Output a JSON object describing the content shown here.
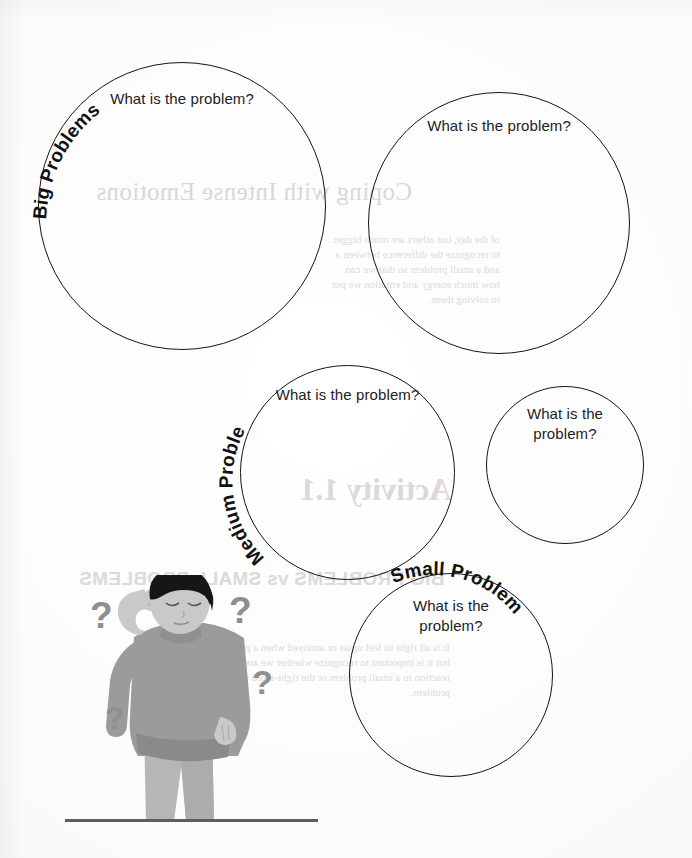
{
  "page": {
    "title": "Big Problems vs Small Problems",
    "background_color": "#fdfdfd",
    "ink_color": "#141414",
    "width": 692,
    "height": 858
  },
  "worksheet": {
    "prompt_text": "What is the problem?",
    "circles": [
      {
        "id": "big-problem-1",
        "category_label": "Big Problems",
        "prompt": "What is the problem?",
        "size": "large",
        "x": 38,
        "y": 62,
        "diameter": 288
      },
      {
        "id": "big-problem-2",
        "category_label": "",
        "prompt": "What is the problem?",
        "size": "large",
        "x": 368,
        "y": 92,
        "diameter": 262
      },
      {
        "id": "medium-problem-1",
        "category_label": "Medium Problems",
        "prompt": "What is the problem?",
        "size": "medium",
        "x": 240,
        "y": 365,
        "diameter": 215
      },
      {
        "id": "medium-problem-2",
        "category_label": "",
        "prompt": "What is the problem?",
        "size": "medium",
        "x": 486,
        "y": 386,
        "diameter": 158
      },
      {
        "id": "small-problem-1",
        "category_label": "Small Problem",
        "prompt": "What is the problem?",
        "size": "small",
        "x": 349,
        "y": 573,
        "diameter": 204
      }
    ],
    "category_labels": [
      "Big Problems",
      "Medium Problems",
      "Small Problem"
    ]
  },
  "illustration": {
    "name": "confused-person-with-question-marks",
    "description": "Grayscale drawing of a person scratching their head surrounded by question marks",
    "question_mark_glyph": "?",
    "question_marks": [
      {
        "x": 28,
        "y": 20,
        "size": 37
      },
      {
        "x": 167,
        "y": 15,
        "size": 37
      },
      {
        "x": 190,
        "y": 88,
        "size": 34
      },
      {
        "x": 43,
        "y": 125,
        "size": 32
      }
    ],
    "colors": {
      "hair": "#161616",
      "skin": "#c9c9c9",
      "sweater": "#9b9b9b",
      "sweater_shadow": "#8a8a8a",
      "pants": "#b6b6b6",
      "pants_shadow": "#a3a3a3",
      "question_mark": "#8f8f8f",
      "ground_line": "#5e5e5e"
    }
  },
  "bleed_through": {
    "note": "faint mirrored text showing through from the reverse side of the page",
    "items": [
      {
        "text": "Coping with Intense Emotions",
        "kind": "title",
        "x": 96,
        "y": 178
      },
      {
        "text": "Activity 1.1",
        "kind": "activity",
        "x": 300,
        "y": 472
      },
      {
        "text": "BIG PROBLEMS vs SMALL PROBLEMS",
        "kind": "heading",
        "x": 79,
        "y": 568
      }
    ],
    "body_lines_upper": [
      "of the day, but others are much bigger.",
      "to recognize the difference between a",
      "and a small problem so that we can",
      "how much energy and emotion we put",
      "to solving them."
    ],
    "body_lines_lower": [
      "It is all right to feel upset or annoyed when a problem comes up,",
      "but it is important to recognize whether we are having a big",
      "reaction to a small problem or the right-sized reaction to a big",
      "problem."
    ]
  }
}
